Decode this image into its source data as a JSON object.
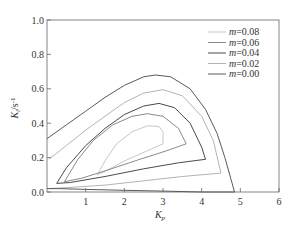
{
  "chart_data": {
    "type": "line",
    "title": "",
    "xlabel": "K_p",
    "ylabel": "K_i/s^-1",
    "xlim": [
      0,
      6
    ],
    "ylim": [
      0,
      1.0
    ],
    "xticks": [
      1,
      2,
      3,
      4,
      5,
      6
    ],
    "yticks": [
      0.0,
      0.2,
      0.4,
      0.6,
      0.8,
      1.0
    ],
    "grid": false,
    "legend_position": "upper right",
    "series": [
      {
        "name": "m=0.08",
        "color": "#c8c8c8",
        "points": [
          [
            1.3,
            0.1
          ],
          [
            1.5,
            0.18
          ],
          [
            1.8,
            0.28
          ],
          [
            2.2,
            0.35
          ],
          [
            2.6,
            0.385
          ],
          [
            2.9,
            0.38
          ],
          [
            3.0,
            0.35
          ],
          [
            3.0,
            0.28
          ],
          [
            2.6,
            0.24
          ],
          [
            2.0,
            0.18
          ],
          [
            1.5,
            0.12
          ],
          [
            1.3,
            0.1
          ]
        ]
      },
      {
        "name": "m=0.06",
        "color": "#8a8a8a",
        "points": [
          [
            0.45,
            0.06
          ],
          [
            0.8,
            0.19
          ],
          [
            1.2,
            0.3
          ],
          [
            1.7,
            0.39
          ],
          [
            2.2,
            0.44
          ],
          [
            2.6,
            0.455
          ],
          [
            3.0,
            0.44
          ],
          [
            3.4,
            0.37
          ],
          [
            3.6,
            0.28
          ],
          [
            3.1,
            0.24
          ],
          [
            2.4,
            0.19
          ],
          [
            1.6,
            0.13
          ],
          [
            0.9,
            0.08
          ],
          [
            0.45,
            0.06
          ]
        ]
      },
      {
        "name": "m=0.04",
        "color": "#4a4a4a",
        "points": [
          [
            0.25,
            0.05
          ],
          [
            0.5,
            0.14
          ],
          [
            1.0,
            0.27
          ],
          [
            1.5,
            0.37
          ],
          [
            2.0,
            0.45
          ],
          [
            2.5,
            0.5
          ],
          [
            2.9,
            0.515
          ],
          [
            3.3,
            0.49
          ],
          [
            3.7,
            0.4
          ],
          [
            4.0,
            0.26
          ],
          [
            4.1,
            0.19
          ],
          [
            3.4,
            0.17
          ],
          [
            2.5,
            0.135
          ],
          [
            1.5,
            0.09
          ],
          [
            0.6,
            0.055
          ],
          [
            0.25,
            0.05
          ]
        ]
      },
      {
        "name": "m=0.02",
        "color": "#b4b4b4",
        "points": [
          [
            0.05,
            0.19
          ],
          [
            0.5,
            0.27
          ],
          [
            1.0,
            0.36
          ],
          [
            1.5,
            0.44
          ],
          [
            2.0,
            0.52
          ],
          [
            2.5,
            0.575
          ],
          [
            3.0,
            0.595
          ],
          [
            3.5,
            0.56
          ],
          [
            4.0,
            0.44
          ],
          [
            4.3,
            0.3
          ],
          [
            4.5,
            0.11
          ],
          [
            3.5,
            0.09
          ],
          [
            2.5,
            0.065
          ],
          [
            1.5,
            0.04
          ],
          [
            0.5,
            0.025
          ],
          [
            0.05,
            0.02
          ]
        ]
      },
      {
        "name": "m=0.00",
        "color": "#5a5a5a",
        "points": [
          [
            0.0,
            0.31
          ],
          [
            0.5,
            0.39
          ],
          [
            1.0,
            0.47
          ],
          [
            1.5,
            0.55
          ],
          [
            2.0,
            0.62
          ],
          [
            2.5,
            0.67
          ],
          [
            2.8,
            0.68
          ],
          [
            3.2,
            0.67
          ],
          [
            3.7,
            0.6
          ],
          [
            4.1,
            0.48
          ],
          [
            4.4,
            0.34
          ],
          [
            4.6,
            0.2
          ],
          [
            4.75,
            0.08
          ],
          [
            4.85,
            0.0
          ],
          [
            4.0,
            0.0
          ],
          [
            3.0,
            0.005
          ],
          [
            2.0,
            0.01
          ],
          [
            1.0,
            0.015
          ],
          [
            0.3,
            0.02
          ],
          [
            0.0,
            0.02
          ]
        ]
      }
    ]
  },
  "axes": {
    "x_title_main": "K",
    "x_title_sub": "p",
    "y_title_main": "K",
    "y_title_sub": "i",
    "y_title_unit": "/s",
    "y_title_sup": "-1",
    "x_tick_labels": [
      "1",
      "2",
      "3",
      "4",
      "5",
      "6"
    ],
    "y_tick_labels": [
      "0.0",
      "0.2",
      "0.4",
      "0.6",
      "0.8",
      "1.0"
    ]
  },
  "legend": {
    "items": [
      {
        "prefix": "m",
        "value": "=0.08",
        "color": "#c8c8c8"
      },
      {
        "prefix": "m",
        "value": "=0.06",
        "color": "#8a8a8a"
      },
      {
        "prefix": "m",
        "value": "=0.04",
        "color": "#4a4a4a"
      },
      {
        "prefix": "m",
        "value": "=0.02",
        "color": "#b4b4b4"
      },
      {
        "prefix": "m",
        "value": "=0.00",
        "color": "#5a5a5a"
      }
    ]
  }
}
